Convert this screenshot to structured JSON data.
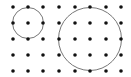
{
  "diagram": {
    "type": "dot-grid-with-circles",
    "background": "#ffffff",
    "dot_color": "#111111",
    "circle_color": "#777777",
    "dot_radius": 1.8,
    "grid": {
      "x": [
        13,
        28,
        43,
        59,
        75,
        90,
        106,
        121
      ],
      "y": [
        7,
        23,
        39,
        55,
        71
      ]
    },
    "circles": [
      {
        "name": "small-circle",
        "cx": 28,
        "cy": 23,
        "r": 15.5
      },
      {
        "name": "large-circle",
        "cx": 90,
        "cy": 39,
        "r": 31.5
      }
    ]
  }
}
